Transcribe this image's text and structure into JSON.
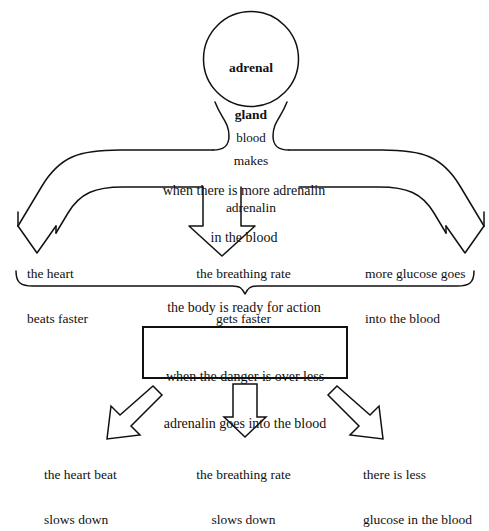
{
  "diagram": {
    "source_node": {
      "shape": "circle",
      "line1": "adrenal",
      "line2": "gland",
      "line3": "makes",
      "line4": "adrenalin"
    },
    "funnel_label": "blood",
    "band_text": {
      "line1": "when there is more adrenalin",
      "line2": "in the blood"
    },
    "effects_increase": [
      {
        "line1": "the heart",
        "line2": "beats faster"
      },
      {
        "line1": "the breathing rate",
        "line2": "gets faster"
      },
      {
        "line1": "more glucose goes",
        "line2": "into the blood"
      }
    ],
    "brace_summary": "the body is ready for action",
    "reverse_box": {
      "line1": "when the danger is over less",
      "line2": "adrenalin goes into the blood"
    },
    "effects_decrease": [
      {
        "line1": "the heart beat",
        "line2": "slows down"
      },
      {
        "line1": "the breathing rate",
        "line2": "slows down"
      },
      {
        "line1": "there is less",
        "line2": "glucose in the blood"
      }
    ],
    "colors": {
      "ink": "#111111",
      "paper": "#ffffff"
    }
  }
}
